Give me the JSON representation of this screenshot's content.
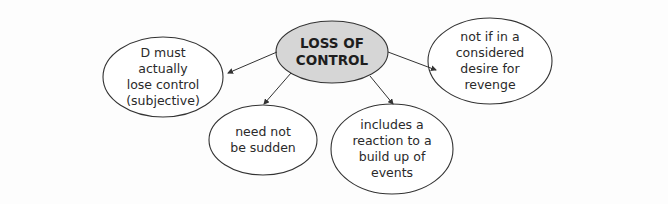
{
  "diagram": {
    "type": "mind-map",
    "center": {
      "label": "LOSS OF\nCONTROL",
      "fill": "#d6d6d6"
    },
    "branches": [
      {
        "id": "subjective",
        "label": "D must\nactually\nlose control\n(subjective)"
      },
      {
        "id": "sudden",
        "label": "need not\nbe sudden"
      },
      {
        "id": "buildup",
        "label": "includes a\nreaction to a\nbuild up of\nevents"
      },
      {
        "id": "revenge",
        "label": "not if in a\nconsidered\ndesire for\nrevenge"
      }
    ],
    "colors": {
      "stroke": "#333333",
      "node_fill": "#ffffff",
      "background": "#fdfdfd"
    }
  }
}
